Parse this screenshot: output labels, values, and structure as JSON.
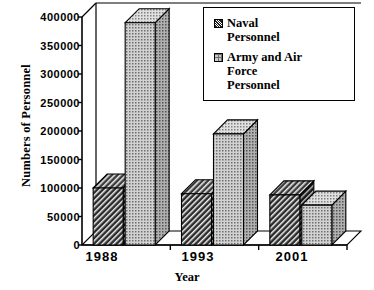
{
  "chart_data": {
    "type": "bar",
    "title": "",
    "subtitle": "",
    "xlabel": "Year",
    "ylabel": "Numbers of Personnel",
    "categories": [
      "1988",
      "1993",
      "2001"
    ],
    "series": [
      {
        "name": "Naval Personnel",
        "values": [
          100000,
          90000,
          88000
        ],
        "pattern": "diagonal-hatch",
        "color": "#2a2a2a"
      },
      {
        "name": "Army and Air Force Personnel",
        "values": [
          390000,
          195000,
          70000
        ],
        "pattern": "stipple-dots",
        "color": "#c9c9c9"
      }
    ],
    "ylim": [
      0,
      400000
    ],
    "yticks": [
      0,
      50000,
      100000,
      150000,
      200000,
      250000,
      300000,
      350000,
      400000
    ],
    "ytick_labels": [
      "0",
      "50000",
      "100000",
      "150000",
      "200000",
      "250000",
      "300000",
      "350000",
      "400000"
    ],
    "grid": false,
    "legend_position": "top-right",
    "style": "3d-bar"
  },
  "legend": {
    "entries": [
      {
        "label_line1": "Naval",
        "label_line2": "Personnel",
        "swatch": "hatch-swatch"
      },
      {
        "label_line1": "Army and Air",
        "label_line2": "Force",
        "label_line3": "Personnel",
        "swatch": "dots-swatch"
      }
    ]
  }
}
